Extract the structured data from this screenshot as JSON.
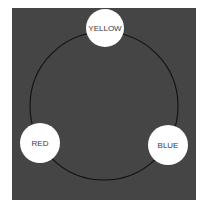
{
  "diagram": {
    "type": "color-wheel-cycle",
    "background_color": "#454545",
    "ring": {
      "cx": 104,
      "cy": 106,
      "r": 74,
      "stroke": "#111111"
    },
    "nodes": [
      {
        "label": "YELLOW",
        "cx": 105,
        "cy": 28,
        "r": 19
      },
      {
        "label": "RED",
        "cx": 40,
        "cy": 143,
        "r": 20
      },
      {
        "label": "BLUE",
        "cx": 168,
        "cy": 145,
        "r": 20
      }
    ]
  }
}
